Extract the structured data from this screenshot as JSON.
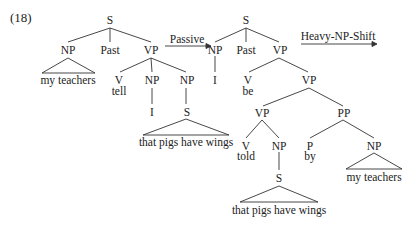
{
  "example_number": "(18)",
  "transformations": {
    "passive": "Passive",
    "heavy_np_shift": "Heavy-NP-Shift"
  },
  "left_tree": {
    "root": "S",
    "np_subject": "NP",
    "np_subject_text": "my teachers",
    "tense": "Past",
    "vp": "VP",
    "v": "V",
    "v_word": "tell",
    "np_obj": "NP",
    "np_obj_word": "I",
    "np_clause": "NP",
    "s_clause": "S",
    "s_clause_text": "that pigs have wings"
  },
  "right_tree": {
    "root": "S",
    "np_subject": "NP",
    "np_subject_word": "I",
    "tense": "Past",
    "vp": "VP",
    "v_aux": "V",
    "v_aux_word": "be",
    "vp2": "VP",
    "vp3": "VP",
    "v_main": "V",
    "v_main_word": "told",
    "np_clause": "NP",
    "s_clause": "S",
    "s_clause_text": "that pigs have wings",
    "pp": "PP",
    "p": "P",
    "p_word": "by",
    "np_agent": "NP",
    "np_agent_text": "my teachers"
  }
}
